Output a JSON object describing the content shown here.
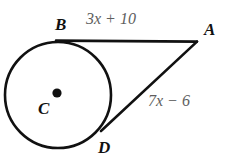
{
  "figure": {
    "kind": "circle-with-two-tangent-segments",
    "background_color": "#ffffff",
    "stroke_color": "#111111",
    "label_color": "#111111",
    "measure_color": "#5e5e5e",
    "points": {
      "center": {
        "label": "C",
        "x": 57,
        "y": 93
      },
      "tangent_top": {
        "label": "B",
        "x": 58,
        "y": 41
      },
      "external": {
        "label": "A",
        "x": 197,
        "y": 41
      },
      "tangent_lower": {
        "label": "D",
        "x": 103,
        "y": 129
      }
    },
    "circle": {
      "cx": 58,
      "cy": 95,
      "r": 53
    },
    "segments": [
      {
        "name": "BA",
        "from": "B",
        "to": "A",
        "measure": "3x + 10"
      },
      {
        "name": "DA",
        "from": "D",
        "to": "A",
        "measure": "7x − 6"
      }
    ],
    "measures": {
      "segment_BA": {
        "full": "3x + 10",
        "coefficient": "3",
        "variable": "x",
        "operator": "+",
        "constant": "10"
      },
      "segment_DA": {
        "full": "7x − 6",
        "coefficient": "7",
        "variable": "x",
        "operator": "−",
        "constant": "6"
      }
    }
  }
}
